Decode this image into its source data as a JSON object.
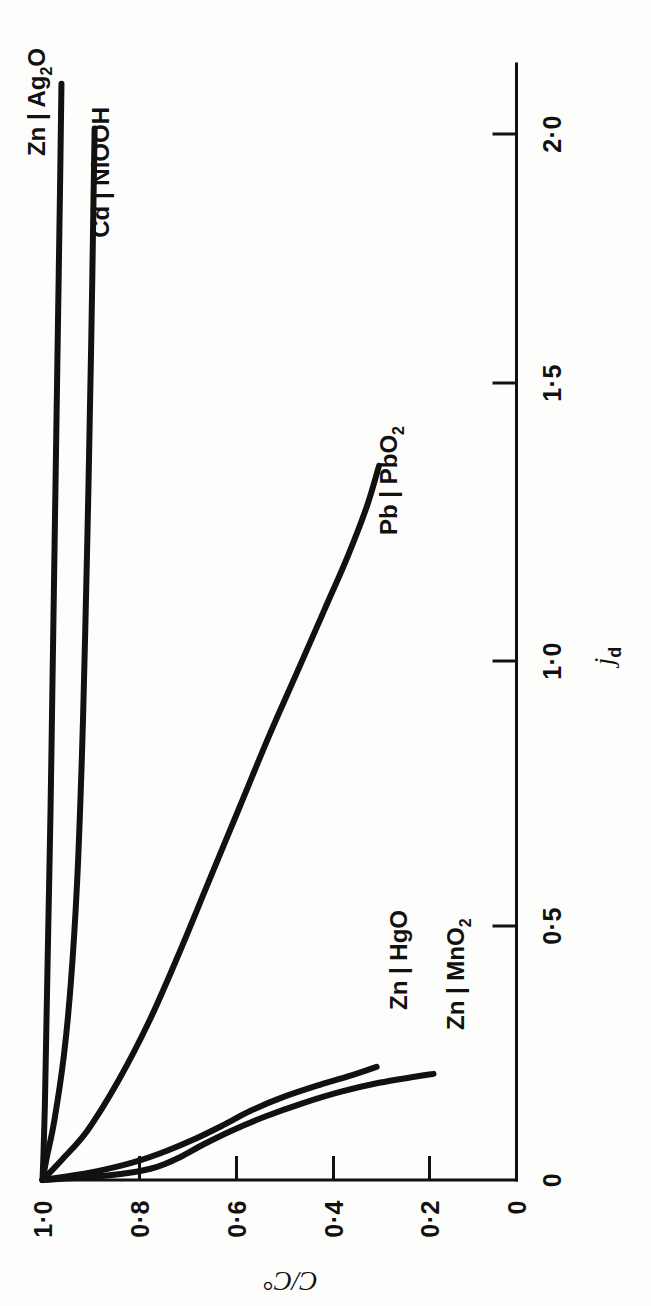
{
  "figure": {
    "background": "#fdfdfc",
    "ink": "#111111",
    "orientation": "page rotated 90 degrees (landscape figure on portrait page)"
  },
  "chart_data": {
    "type": "line",
    "title": "",
    "xlabel": "j",
    "xlabel_sub": "d",
    "ylabel": "C/C°",
    "xlim": [
      0,
      2.25
    ],
    "ylim": [
      0,
      1.05
    ],
    "grid": false,
    "legend": "inline curve end labels",
    "xticks": [
      0,
      0.5,
      1.0,
      1.5,
      2.0
    ],
    "xticklabels": [
      "0",
      "0·5",
      "1·0",
      "1·5",
      "2·0"
    ],
    "yticks": [
      0,
      0.2,
      0.4,
      0.6,
      0.8,
      1.0
    ],
    "yticklabels": [
      "0",
      "0·2",
      "0·4",
      "0·6",
      "0·8",
      "1·0"
    ],
    "series": [
      {
        "name": "Zn | Ag2O",
        "label": "Zn | Ag",
        "label_sub": "2",
        "label_tail": "O",
        "points": [
          [
            0.0,
            1.0
          ],
          [
            0.05,
            0.998
          ],
          [
            0.15,
            0.995
          ],
          [
            0.3,
            0.992
          ],
          [
            0.5,
            0.988
          ],
          [
            0.75,
            0.983
          ],
          [
            1.0,
            0.979
          ],
          [
            1.25,
            0.975
          ],
          [
            1.5,
            0.971
          ],
          [
            1.75,
            0.967
          ],
          [
            2.0,
            0.963
          ],
          [
            2.21,
            0.96
          ]
        ]
      },
      {
        "name": "Cd | NiOOH",
        "label": "Cd | NiOOH",
        "points": [
          [
            0.0,
            1.0
          ],
          [
            0.05,
            0.99
          ],
          [
            0.12,
            0.975
          ],
          [
            0.25,
            0.955
          ],
          [
            0.4,
            0.94
          ],
          [
            0.6,
            0.927
          ],
          [
            0.85,
            0.917
          ],
          [
            1.1,
            0.91
          ],
          [
            1.4,
            0.903
          ],
          [
            1.7,
            0.897
          ],
          [
            2.0,
            0.892
          ],
          [
            2.12,
            0.89
          ]
        ]
      },
      {
        "name": "Pb | PbO2",
        "label": "Pb | PbO",
        "label_sub": "2",
        "points": [
          [
            0.0,
            1.0
          ],
          [
            0.04,
            0.96
          ],
          [
            0.1,
            0.905
          ],
          [
            0.2,
            0.84
          ],
          [
            0.32,
            0.775
          ],
          [
            0.45,
            0.715
          ],
          [
            0.6,
            0.65
          ],
          [
            0.75,
            0.585
          ],
          [
            0.9,
            0.52
          ],
          [
            1.03,
            0.46
          ],
          [
            1.15,
            0.405
          ],
          [
            1.26,
            0.355
          ],
          [
            1.36,
            0.315
          ],
          [
            1.44,
            0.29
          ]
        ]
      },
      {
        "name": "Zn | HgO",
        "label": "Zn | HgO",
        "points": [
          [
            0.0,
            1.0
          ],
          [
            0.01,
            0.93
          ],
          [
            0.022,
            0.865
          ],
          [
            0.038,
            0.8
          ],
          [
            0.058,
            0.74
          ],
          [
            0.082,
            0.68
          ],
          [
            0.11,
            0.62
          ],
          [
            0.14,
            0.56
          ],
          [
            0.168,
            0.49
          ],
          [
            0.192,
            0.415
          ],
          [
            0.212,
            0.345
          ],
          [
            0.228,
            0.295
          ]
        ]
      },
      {
        "name": "Zn | MnO2",
        "label": "Zn | MnO",
        "label_sub": "2",
        "points": [
          [
            0.0,
            1.0
          ],
          [
            0.006,
            0.9
          ],
          [
            0.014,
            0.82
          ],
          [
            0.026,
            0.76
          ],
          [
            0.046,
            0.71
          ],
          [
            0.072,
            0.66
          ],
          [
            0.1,
            0.6
          ],
          [
            0.128,
            0.53
          ],
          [
            0.155,
            0.45
          ],
          [
            0.178,
            0.37
          ],
          [
            0.196,
            0.29
          ],
          [
            0.208,
            0.215
          ],
          [
            0.214,
            0.175
          ]
        ]
      }
    ]
  }
}
